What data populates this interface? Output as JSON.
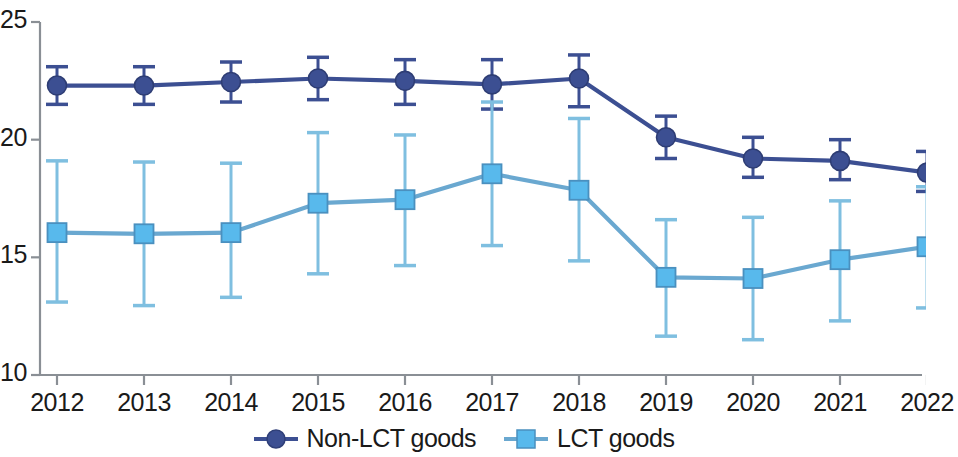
{
  "chart_data": {
    "type": "line",
    "title": "",
    "subtitle": "",
    "xlabel": "",
    "ylabel": "",
    "categories": [
      "2012",
      "2013",
      "2014",
      "2015",
      "2016",
      "2017",
      "2018",
      "2019",
      "2020",
      "2021",
      "2022"
    ],
    "x_tick_labels": [
      "2012",
      "2013",
      "2014",
      "2015",
      "2016",
      "2017",
      "2018",
      "2019",
      "2020",
      "2021",
      "2022"
    ],
    "y_tick_labels": [
      "25",
      "20",
      "15",
      "10"
    ],
    "y_ticks": [
      25,
      20,
      15,
      10
    ],
    "ylim": [
      10,
      25
    ],
    "grid": false,
    "legend_position": "bottom-center",
    "error_bars": true,
    "series": [
      {
        "name": "Non-LCT goods",
        "marker": "circle",
        "color": "#3c4f92",
        "values": [
          22.3,
          22.3,
          22.45,
          22.6,
          22.5,
          22.35,
          22.6,
          20.1,
          19.2,
          19.1,
          18.6
        ],
        "err_low": [
          21.5,
          21.5,
          21.6,
          21.7,
          21.5,
          21.3,
          21.4,
          19.2,
          18.4,
          18.3,
          17.8
        ],
        "err_high": [
          23.1,
          23.1,
          23.3,
          23.5,
          23.4,
          23.4,
          23.6,
          21.0,
          20.1,
          20.0,
          19.5
        ]
      },
      {
        "name": "LCT goods",
        "marker": "square",
        "color": "#54b3e4",
        "values": [
          16.05,
          16.0,
          16.05,
          17.3,
          17.45,
          18.55,
          17.85,
          14.15,
          14.1,
          14.9,
          15.45
        ],
        "err_low": [
          13.1,
          12.95,
          13.3,
          14.3,
          14.65,
          15.5,
          14.85,
          11.65,
          11.5,
          12.3,
          12.85
        ],
        "err_high": [
          19.1,
          19.05,
          19.0,
          20.3,
          20.2,
          21.6,
          20.9,
          16.6,
          16.7,
          17.4,
          18.0
        ]
      }
    ]
  },
  "legend": {
    "items": [
      {
        "label": "Non-LCT goods",
        "color": "#3c4f92",
        "marker": "circle"
      },
      {
        "label": "LCT goods",
        "color": "#54b3e4",
        "marker": "square"
      }
    ]
  },
  "axis": {
    "line_color": "#8a8f95",
    "tick_color": "#8a8f95"
  },
  "colors": {
    "non_lct": "#3c4f92",
    "lct": "#54b3e4",
    "lct_fill": "#58b9ec",
    "text": "#1a1a1a"
  }
}
